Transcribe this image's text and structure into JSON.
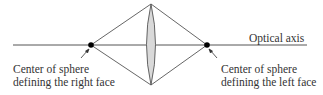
{
  "diagram": {
    "axis_label": "Optical axis",
    "left_center_label": [
      "Center of sphere",
      "defining the right face"
    ],
    "right_center_label": [
      "Center of sphere",
      "defining the left face"
    ],
    "colors": {
      "line": "#555555",
      "lens_fill": "#d9d9d9",
      "dot": "#000000"
    }
  }
}
